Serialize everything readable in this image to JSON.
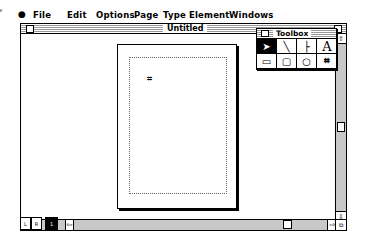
{
  "menubar": {
    "apple_label": "",
    "items": [
      {
        "label": "File",
        "x": 33
      },
      {
        "label": "Edit",
        "x": 67
      },
      {
        "label": "Options",
        "x": 96
      },
      {
        "label": "Page",
        "x": 134
      },
      {
        "label": "Type",
        "x": 163
      },
      {
        "label": "Element",
        "x": 189
      },
      {
        "label": "Windows",
        "x": 229
      }
    ]
  },
  "document_window": {
    "title": "Untitled",
    "cursor_glyph": "⌗",
    "page_buttons": [
      {
        "label": "L"
      },
      {
        "label": "R"
      },
      {
        "label": "1"
      }
    ],
    "scroll_up_glyph": "⇧",
    "scroll_down_glyph": "⇩",
    "scroll_left_glyph": "⇦",
    "scroll_right_glyph": "⇨",
    "grow_glyph": "⧉"
  },
  "toolbox": {
    "title": "Toolbox",
    "tools": [
      {
        "name": "pointer-tool",
        "glyph": "➤",
        "selected": true
      },
      {
        "name": "diagonal-line-tool",
        "glyph": "╲",
        "selected": false
      },
      {
        "name": "orthogonal-line-tool",
        "glyph": "├",
        "selected": false
      },
      {
        "name": "text-tool",
        "glyph": "A",
        "selected": false
      },
      {
        "name": "rectangle-tool",
        "glyph": "▭",
        "selected": false
      },
      {
        "name": "rounded-rectangle-tool",
        "glyph": "▢",
        "selected": false
      },
      {
        "name": "oval-tool",
        "glyph": "○",
        "selected": false
      },
      {
        "name": "crop-tool",
        "glyph": "⌗",
        "selected": false
      }
    ]
  }
}
